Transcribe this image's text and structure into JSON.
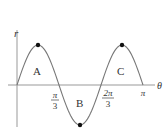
{
  "chart_data": {
    "type": "line",
    "title": "",
    "xlabel": "θ",
    "ylabel": "r",
    "function": "r = sin(3θ)",
    "x_domain": [
      0,
      3.14159
    ],
    "x_ticks": [
      {
        "label_num": "π",
        "label_den": "3",
        "value": 1.0472
      },
      {
        "label_num": "2π",
        "label_den": "3",
        "value": 2.0944
      },
      {
        "label": "π",
        "value": 3.14159
      }
    ],
    "x": [
      0,
      0.5236,
      1.0472,
      1.5708,
      2.0944,
      2.618,
      3.14159
    ],
    "values": [
      0,
      1,
      0,
      -1,
      0,
      1,
      0
    ],
    "extrema_points": [
      {
        "x": 0.5236,
        "y": 1
      },
      {
        "x": 1.5708,
        "y": -1
      },
      {
        "x": 2.618,
        "y": 1
      }
    ],
    "regions": [
      {
        "label": "A",
        "x_range": [
          0,
          1.0472
        ],
        "sign": "positive"
      },
      {
        "label": "B",
        "x_range": [
          1.0472,
          2.0944
        ],
        "sign": "negative"
      },
      {
        "label": "C",
        "x_range": [
          2.0944,
          3.14159
        ],
        "sign": "positive"
      }
    ],
    "grid": false,
    "legend": "none"
  },
  "colors": {
    "curve": "#777777",
    "axis": "#999999",
    "point": "#111111",
    "text": "#333333"
  }
}
